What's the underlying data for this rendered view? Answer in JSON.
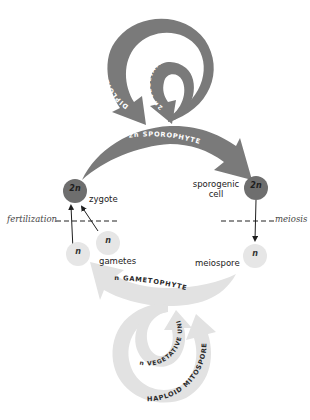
{
  "diagram": {
    "colors": {
      "diploid_arrow": "#7a7a7a",
      "diploid_cell": "#6e6e6e",
      "haploid_arrow": "#e2e2e2",
      "haploid_cell": "#e6e6e6",
      "dark_text": "#1e1e1e",
      "arc_text_light": "#ffffff",
      "arc_text_dark": "#2a2a2a"
    },
    "diploid_phase": {
      "sporophyte_label": "2n SPOROPHYTE",
      "diploid_mitospore_label": "DIPLOID MITOSPORE",
      "vegetative_unit_label": "2n VEGETATIVE UNIT"
    },
    "haploid_phase": {
      "gametophyte_label": "n GAMETOPHYTE",
      "haploid_mitospore_label": "HAPLOID MITOSPORE",
      "vegetative_unit_label": "n VEGETATIVE UNIT"
    },
    "cells": {
      "zygote": {
        "ploidy": "2n",
        "label": "zygote"
      },
      "sporogenic_cell": {
        "ploidy": "2n",
        "label_line1": "sporogenic",
        "label_line2": "cell"
      },
      "gamete_1": {
        "ploidy": "n"
      },
      "gamete_2": {
        "ploidy": "n"
      },
      "gametes_label": "gametes",
      "meiospore": {
        "ploidy": "n",
        "label": "meiospore"
      }
    },
    "events": {
      "fertilization": "fertilization",
      "meiosis": "meiosis"
    }
  }
}
